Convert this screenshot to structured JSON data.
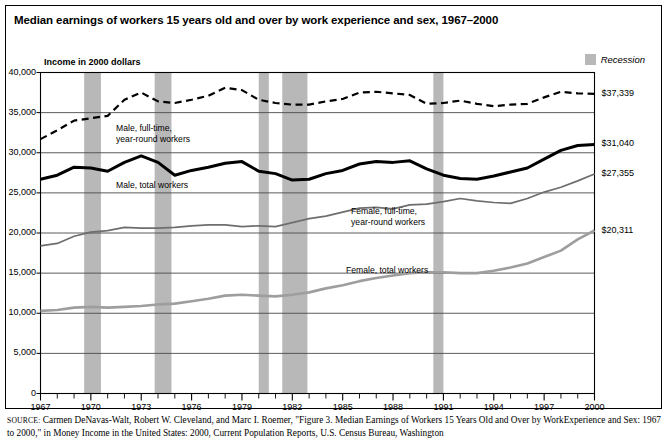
{
  "figure": {
    "title": "Median earnings of workers 15 years old and over by work experience and sex, 1967–2000",
    "y_axis_caption": "Income in 2000 dollars",
    "legend": {
      "recession_label": "Recession",
      "recession_color": "#b8b8b8"
    },
    "source_prefix": "SOURCE:",
    "source_text": " Carmen DeNavas-Walt, Robert W. Cleveland, and Marc I. Roemer, \"Figure 3. Median Earnings of Workers 15 Years Old and Over by Work",
    "source_text_line2": "Experience and Sex: 1967 to 2000,\" in Money Income in the United States: 2000, Current Population Reports, U.S. Census Bureau, Washington"
  },
  "chart_data": {
    "type": "line",
    "title": "Median earnings of workers 15 years old and over by work experience and sex, 1967–2000",
    "xlabel": "",
    "ylabel": "Income in 2000 dollars",
    "xlim": [
      1967,
      2000
    ],
    "ylim": [
      0,
      40000
    ],
    "grid": true,
    "legend_position": "inline-annotations",
    "ytick_labels": [
      "0",
      "5,000",
      "10,000",
      "15,000",
      "20,000",
      "25,000",
      "30,000",
      "35,000",
      "40,000"
    ],
    "ytick_values": [
      0,
      5000,
      10000,
      15000,
      20000,
      25000,
      30000,
      35000,
      40000
    ],
    "xtick_labels": [
      "1967",
      "1970",
      "1973",
      "1976",
      "1979",
      "1982",
      "1985",
      "1988",
      "1991",
      "1994",
      "1997",
      "2000"
    ],
    "xtick_values": [
      1967,
      1970,
      1973,
      1976,
      1979,
      1982,
      1985,
      1988,
      1991,
      1994,
      1997,
      2000
    ],
    "x": [
      1967,
      1968,
      1969,
      1970,
      1971,
      1972,
      1973,
      1974,
      1975,
      1976,
      1977,
      1978,
      1979,
      1980,
      1981,
      1982,
      1983,
      1984,
      1985,
      1986,
      1987,
      1988,
      1989,
      1990,
      1991,
      1992,
      1993,
      1994,
      1995,
      1996,
      1997,
      1998,
      1999,
      2000
    ],
    "series": [
      {
        "name": "Male, full-time, year-round workers",
        "label": "Male, full-time,\nyear-round workers",
        "style": "dashed",
        "color": "#000000",
        "width": 2.2,
        "end_value_label": "$37,339",
        "end_value": 37339,
        "values": [
          31700,
          32800,
          34000,
          34300,
          34600,
          36600,
          37500,
          36400,
          36200,
          36600,
          37100,
          38100,
          37800,
          36600,
          36200,
          36000,
          36000,
          36400,
          36700,
          37500,
          37600,
          37400,
          37200,
          36100,
          36200,
          36500,
          36100,
          35800,
          36000,
          36100,
          36900,
          37600,
          37400,
          37339
        ]
      },
      {
        "name": "Male, total workers",
        "label": "Male, total workers",
        "style": "solid",
        "color": "#000000",
        "width": 3.0,
        "end_value_label": "$31,040",
        "end_value": 31040,
        "values": [
          26700,
          27200,
          28200,
          28100,
          27700,
          28800,
          29600,
          28800,
          27200,
          27800,
          28200,
          28700,
          28900,
          27700,
          27400,
          26600,
          26700,
          27400,
          27800,
          28600,
          28900,
          28800,
          29000,
          28000,
          27200,
          26800,
          26700,
          27100,
          27600,
          28100,
          29200,
          30300,
          30900,
          31040
        ]
      },
      {
        "name": "Female, full-time, year-round workers",
        "label": "Female, full-time,\nyear-round workers",
        "style": "solid",
        "color": "#6e6e6e",
        "width": 1.7,
        "end_value_label": "$27,355",
        "end_value": 27355,
        "values": [
          18400,
          18700,
          19600,
          20100,
          20300,
          20700,
          20600,
          20600,
          20700,
          20900,
          21000,
          21000,
          20800,
          20900,
          20800,
          21300,
          21800,
          22100,
          22600,
          23100,
          23200,
          23000,
          23500,
          23600,
          23900,
          24300,
          24000,
          23800,
          23700,
          24300,
          25100,
          25700,
          26500,
          27355
        ]
      },
      {
        "name": "Female, total workers",
        "label": "Female, total workers",
        "style": "solid",
        "color": "#9e9e9e",
        "width": 2.6,
        "end_value_label": "$20,311",
        "end_value": 20311,
        "values": [
          10300,
          10400,
          10700,
          10800,
          10700,
          10800,
          10900,
          11100,
          11200,
          11500,
          11800,
          12200,
          12300,
          12200,
          12100,
          12300,
          12600,
          13100,
          13500,
          14000,
          14400,
          14700,
          15000,
          15100,
          15100,
          15000,
          15000,
          15300,
          15700,
          16200,
          17000,
          17800,
          19200,
          20311
        ]
      }
    ],
    "recession_bands": [
      {
        "start": 1969.6,
        "end": 1970.6
      },
      {
        "start": 1973.8,
        "end": 1974.8
      },
      {
        "start": 1980.0,
        "end": 1980.6
      },
      {
        "start": 1981.4,
        "end": 1982.9
      },
      {
        "start": 1990.4,
        "end": 1991.0
      }
    ],
    "annotations": [
      {
        "text": "Male, full-time,\nyear-round workers",
        "x": 1971.5,
        "y": 33000
      },
      {
        "text": "Male, total workers",
        "x": 1971.5,
        "y": 25900
      },
      {
        "text": "Female, full-time,\nyear-round workers",
        "x": 1985.5,
        "y": 22600
      },
      {
        "text": "Female, total workers",
        "x": 1985.2,
        "y": 15300
      }
    ]
  }
}
